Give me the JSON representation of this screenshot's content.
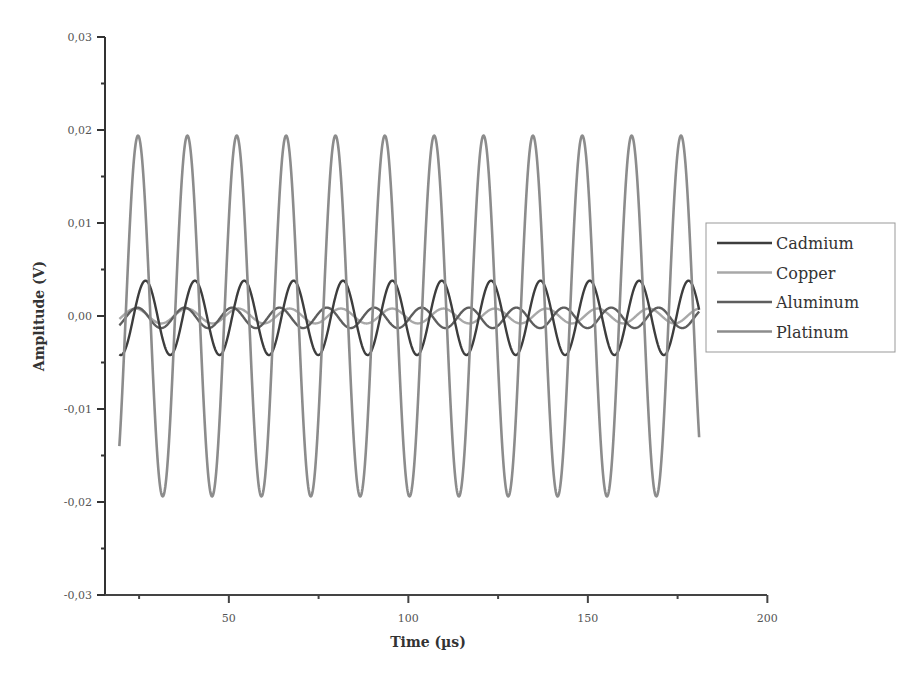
{
  "chart_data": {
    "type": "line",
    "title": "",
    "xlabel": "Time (µs)",
    "ylabel": "Amplitude (V)",
    "xlim": [
      15.5,
      200
    ],
    "ylim": [
      -0.03,
      0.03
    ],
    "x_ticks": [
      50,
      100,
      150,
      200
    ],
    "x_tick_labels": [
      "50",
      "100",
      "150",
      "200"
    ],
    "x_minor_ticks": [
      25,
      75,
      125,
      175
    ],
    "y_ticks": [
      -0.03,
      -0.02,
      -0.01,
      0.0,
      0.01,
      0.02,
      0.03
    ],
    "y_tick_labels": [
      "-0,03",
      "-0,02",
      "-0,01",
      "0,00",
      "0,01",
      "0,02",
      "0,03"
    ],
    "y_minor_ticks": [
      -0.025,
      -0.015,
      -0.005,
      0.005,
      0.015,
      0.025
    ],
    "grid": false,
    "legend_position": "right",
    "x_range_data": [
      19.5,
      181
    ],
    "series": [
      {
        "name": "Cadmium",
        "color": "#3d3d3d",
        "amplitude": 0.004,
        "period": 13.75,
        "peak_time": 26.8,
        "offset": -0.0002
      },
      {
        "name": "Copper",
        "color": "#a8a8a8",
        "amplitude": 0.0008,
        "period": 14.3,
        "peak_time": 24.0,
        "offset": 0.0
      },
      {
        "name": "Aluminum",
        "color": "#5e5e5e",
        "amplitude": 0.0011,
        "period": 13.2,
        "peak_time": 24.5,
        "offset": -0.0002
      },
      {
        "name": "Platinum",
        "color": "#8c8c8c",
        "amplitude": 0.0194,
        "period": 13.75,
        "peak_time": 24.7,
        "offset": 0.0
      }
    ],
    "samples_note": "Sinusoids: Platinum peaks ≈ +0.0194 / troughs ≈ -0.0193 (12 cycles); Cadmium ±0.004; Copper and Aluminum ≈ ±0.001"
  },
  "legend": {
    "items": [
      {
        "label": "Cadmium",
        "color": "#3d3d3d"
      },
      {
        "label": "Copper",
        "color": "#a8a8a8"
      },
      {
        "label": "Aluminum",
        "color": "#5e5e5e"
      },
      {
        "label": "Platinum",
        "color": "#8c8c8c"
      }
    ]
  },
  "axes": {
    "x_title": "Time (µs)",
    "y_title": "Amplitude (V)"
  }
}
